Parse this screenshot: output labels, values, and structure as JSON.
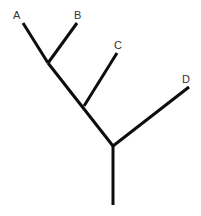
{
  "diagram": {
    "type": "phylogenetic-tree",
    "line_color": "#0d0d0d",
    "label_color": "#333333",
    "leaves": [
      {
        "id": "A",
        "label": "A",
        "label_x": 15,
        "label_y": 19,
        "tip_x": 23,
        "tip_y": 23
      },
      {
        "id": "B",
        "label": "B",
        "label_x": 75,
        "label_y": 19,
        "tip_x": 77,
        "tip_y": 23
      },
      {
        "id": "C",
        "label": "C",
        "label_x": 114,
        "label_y": 48,
        "tip_x": 117,
        "tip_y": 53
      },
      {
        "id": "D",
        "label": "D",
        "label_x": 182,
        "label_y": 82,
        "tip_x": 189,
        "tip_y": 87
      }
    ],
    "nodes": [
      {
        "id": "AB",
        "x": 48,
        "y": 63
      },
      {
        "id": "ABC",
        "x": 84,
        "y": 106
      },
      {
        "id": "root",
        "x": 113,
        "y": 146
      }
    ],
    "root_stem": {
      "x": 113,
      "y_top": 146,
      "y_bottom": 205
    }
  }
}
